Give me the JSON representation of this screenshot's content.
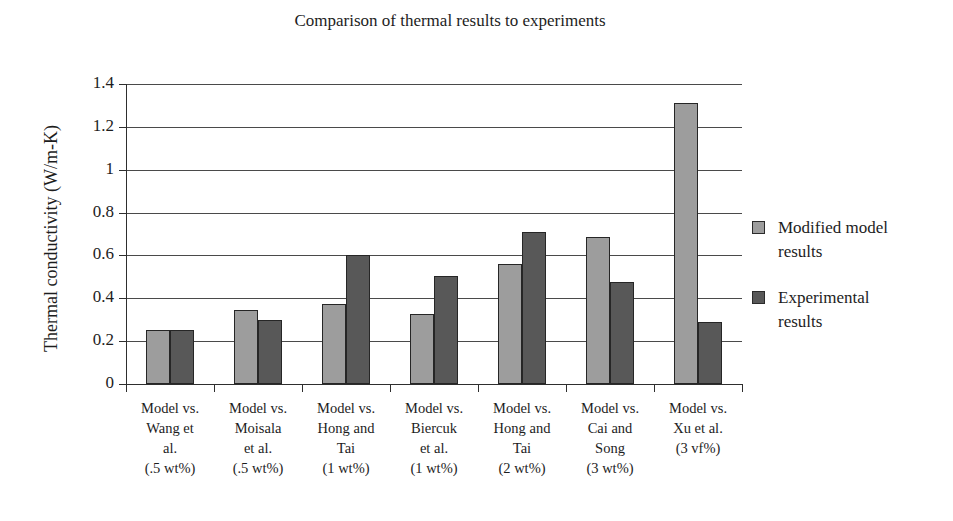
{
  "chart_data": {
    "type": "bar",
    "title": "Comparison of thermal results to experiments",
    "xlabel": "",
    "ylabel": "Thermal conductivity (W/m-K)",
    "ylim": [
      0,
      1.4
    ],
    "ytick_labels": [
      "1.4",
      "1.2",
      "1",
      "0.8",
      "0.6",
      "0.4",
      "0.2",
      "0"
    ],
    "ytick_values": [
      1.4,
      1.2,
      1.0,
      0.8,
      0.6,
      0.4,
      0.2,
      0
    ],
    "grid": true,
    "legend_position": "right",
    "categories": [
      "Model vs. Wang et al. (.5 wt%)",
      "Model vs. Moisala et al. (.5 wt%)",
      "Model vs. Hong and Tai (1 wt%)",
      "Model vs. Biercuk et al. (1 wt%)",
      "Model vs. Hong and Tai (2 wt%)",
      "Model vs. Cai and Song (3 wt%)",
      "Model vs. Xu et al. (3 vf%)"
    ],
    "category_lines": [
      [
        "Model vs.",
        "Wang et",
        "al.",
        "(.5 wt%)"
      ],
      [
        "Model vs.",
        "Moisala",
        "et al.",
        "(.5 wt%)"
      ],
      [
        "Model vs.",
        "Hong and",
        "Tai",
        "(1 wt%)"
      ],
      [
        "Model vs.",
        "Biercuk",
        "et al.",
        "(1 wt%)"
      ],
      [
        "Model vs.",
        "Hong and",
        "Tai",
        "(2 wt%)"
      ],
      [
        "Model vs.",
        "Cai and",
        "Song",
        "(3 wt%)"
      ],
      [
        "Model vs.",
        "Xu et al.",
        "(3 vf%)",
        ""
      ]
    ],
    "series": [
      {
        "name": "Modified model results",
        "color": "#9d9d9d",
        "values": [
          0.25,
          0.345,
          0.375,
          0.325,
          0.56,
          0.685,
          1.31
        ]
      },
      {
        "name": "Experimental results",
        "color": "#585858",
        "values": [
          0.25,
          0.3,
          0.6,
          0.505,
          0.71,
          0.475,
          0.29
        ]
      }
    ]
  },
  "legend": {
    "items": [
      {
        "label_line1": "Modified model",
        "label_line2": "results"
      },
      {
        "label_line1": "Experimental",
        "label_line2": "results"
      }
    ]
  },
  "colors": {
    "series_light": "#9d9d9d",
    "series_dark": "#585858",
    "axis": "#2e2e2e",
    "grid": "#4a4a4a",
    "text": "#1d1d1d",
    "background": "#ffffff"
  }
}
